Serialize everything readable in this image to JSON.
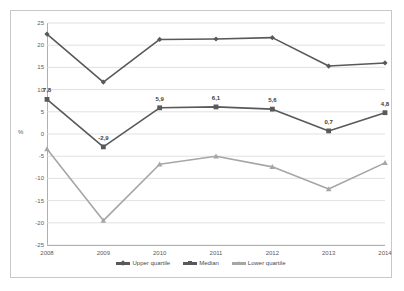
{
  "chart_data": {
    "type": "line",
    "title": "",
    "xlabel": "",
    "ylabel": "%",
    "categories": [
      "2008",
      "2009",
      "2010",
      "2011",
      "2012",
      "2013",
      "2014"
    ],
    "ylim": [
      -25,
      25
    ],
    "ytick_step": 5,
    "yticks": [
      "25",
      "20",
      "15",
      "10",
      "5",
      "0",
      "-5",
      "-10",
      "-15",
      "-20",
      "-25"
    ],
    "grid": "horizontal",
    "legend_position": "bottom",
    "series": [
      {
        "name": "Upper quartile",
        "color": "#595959",
        "marker": "diamond",
        "values": [
          22.5,
          11.7,
          21.3,
          21.4,
          21.7,
          15.3,
          16.0
        ],
        "labels": [
          "",
          "",
          "",
          "",
          "",
          "",
          ""
        ]
      },
      {
        "name": "Median",
        "color": "#595959",
        "marker": "square",
        "values": [
          7.8,
          -2.9,
          5.9,
          6.1,
          5.6,
          0.7,
          4.8
        ],
        "labels": [
          "7,8",
          "-2,9",
          "5,9",
          "6,1",
          "5,6",
          "0,7",
          "4,8"
        ]
      },
      {
        "name": "Lower quartile",
        "color": "#a6a6a6",
        "marker": "triangle",
        "values": [
          -3.4,
          -19.5,
          -6.8,
          -5.0,
          -7.4,
          -12.4,
          -6.5
        ],
        "labels": [
          "",
          "",
          "",
          "",
          "",
          "",
          ""
        ]
      }
    ]
  },
  "legend": {
    "items": [
      {
        "label": "Upper quartile"
      },
      {
        "label": "Median"
      },
      {
        "label": "Lower quartile"
      }
    ]
  },
  "axis": {
    "y_title": "%"
  }
}
